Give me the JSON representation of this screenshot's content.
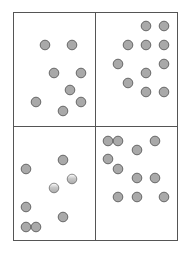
{
  "figure": {
    "width": 185,
    "height": 254,
    "background": "#ffffff",
    "grid": {
      "left": 13.5,
      "top": 12.5,
      "right": 177.5,
      "bottom": 240.5,
      "mid_x": 95.5,
      "mid_y": 126.5,
      "stroke": "#555555",
      "stroke_width": 1
    },
    "dot_style": {
      "radius": 4.8,
      "fill": "#a9a9a9",
      "stroke": "#666666",
      "stroke_width": 1
    },
    "panels": [
      {
        "id": "top-left",
        "dot_count": 8,
        "dots": [
          {
            "x": 45,
            "y": 45
          },
          {
            "x": 72,
            "y": 45
          },
          {
            "x": 54,
            "y": 73
          },
          {
            "x": 81,
            "y": 73
          },
          {
            "x": 70,
            "y": 90
          },
          {
            "x": 36,
            "y": 102
          },
          {
            "x": 81,
            "y": 102
          },
          {
            "x": 63,
            "y": 111
          }
        ]
      },
      {
        "id": "top-right",
        "dot_count": 11,
        "dots": [
          {
            "x": 146,
            "y": 26
          },
          {
            "x": 164,
            "y": 26
          },
          {
            "x": 128,
            "y": 45
          },
          {
            "x": 146,
            "y": 45
          },
          {
            "x": 164,
            "y": 45
          },
          {
            "x": 118,
            "y": 64
          },
          {
            "x": 164,
            "y": 64
          },
          {
            "x": 146,
            "y": 73
          },
          {
            "x": 128,
            "y": 83
          },
          {
            "x": 146,
            "y": 92
          },
          {
            "x": 164,
            "y": 92
          }
        ]
      },
      {
        "id": "bottom-left",
        "dot_count": 8,
        "dots": [
          {
            "x": 63,
            "y": 160
          },
          {
            "x": 26,
            "y": 169
          },
          {
            "x": 72,
            "y": 179,
            "faded": true
          },
          {
            "x": 54,
            "y": 188,
            "faded": true
          },
          {
            "x": 26,
            "y": 207
          },
          {
            "x": 63,
            "y": 217
          },
          {
            "x": 26,
            "y": 227
          },
          {
            "x": 36,
            "y": 227
          }
        ]
      },
      {
        "id": "bottom-right",
        "dot_count": 11,
        "dots": [
          {
            "x": 108,
            "y": 141
          },
          {
            "x": 118,
            "y": 141
          },
          {
            "x": 155,
            "y": 141
          },
          {
            "x": 137,
            "y": 150
          },
          {
            "x": 108,
            "y": 159
          },
          {
            "x": 118,
            "y": 169
          },
          {
            "x": 137,
            "y": 178
          },
          {
            "x": 155,
            "y": 178
          },
          {
            "x": 118,
            "y": 197
          },
          {
            "x": 137,
            "y": 197
          },
          {
            "x": 164,
            "y": 197
          }
        ]
      }
    ]
  }
}
